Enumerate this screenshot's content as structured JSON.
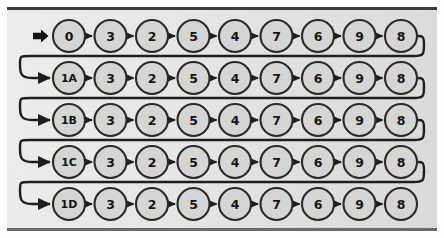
{
  "figure": {
    "panel": {
      "background_color": "#e6e6e4",
      "border_color": "#3c3c3c"
    },
    "node_style": {
      "fill_color": "#d6d6d4",
      "stroke_color": "#2a2a2a",
      "radius": 16
    },
    "edge_style": {
      "color": "#1e1e1e",
      "arrow": "triangle"
    },
    "start_marker": {
      "name": "start-arrow",
      "glyph": "➡",
      "color": "#141414"
    },
    "layout": {
      "rows": 5,
      "columns": 9,
      "first_node_x": 69,
      "column_spacing": 41.5,
      "first_row_y": 36,
      "row_spacing": 42,
      "wrap_direction": "snake"
    },
    "rows": [
      {
        "row_index": 0,
        "head_label": "0",
        "wraps_to_next": true,
        "nodes": [
          "0",
          "3",
          "2",
          "5",
          "4",
          "7",
          "6",
          "9",
          "8"
        ]
      },
      {
        "row_index": 1,
        "head_label": "1A",
        "wraps_to_next": true,
        "nodes": [
          "1A",
          "3",
          "2",
          "5",
          "4",
          "7",
          "6",
          "9",
          "8"
        ]
      },
      {
        "row_index": 2,
        "head_label": "1B",
        "wraps_to_next": true,
        "nodes": [
          "1B",
          "3",
          "2",
          "5",
          "4",
          "7",
          "6",
          "9",
          "8"
        ]
      },
      {
        "row_index": 3,
        "head_label": "1C",
        "wraps_to_next": true,
        "nodes": [
          "1C",
          "3",
          "2",
          "5",
          "4",
          "7",
          "6",
          "9",
          "8"
        ]
      },
      {
        "row_index": 4,
        "head_label": "1D",
        "wraps_to_next": false,
        "nodes": [
          "1D",
          "3",
          "2",
          "5",
          "4",
          "7",
          "6",
          "9",
          "8"
        ]
      }
    ]
  }
}
